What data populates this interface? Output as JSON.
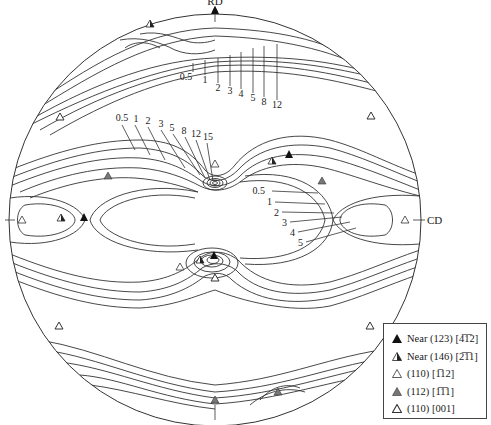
{
  "figure": {
    "type": "pole figure",
    "axes": {
      "top": "RD",
      "right": "CD"
    },
    "contour_levels_top": [
      "0.5",
      "1",
      "2",
      "3",
      "4",
      "5",
      "8",
      "12"
    ],
    "contour_levels_upper_center": [
      "0.5",
      "1",
      "2",
      "3",
      "5",
      "8",
      "12",
      "15"
    ],
    "contour_levels_right": [
      "0.5",
      "1",
      "2",
      "3",
      "4",
      "5"
    ]
  },
  "legend": {
    "items": [
      {
        "marker": "filled-triangle",
        "label": "Near (123) [4̅1̅2]"
      },
      {
        "marker": "half-filled-triangle",
        "label": "Near (146) [2̅1̅1]"
      },
      {
        "marker": "open-triangle",
        "label": "(110) [1̅12]"
      },
      {
        "marker": "grey-filled-triangle",
        "label": "(112) [1̅1̅1]"
      },
      {
        "marker": "dotted-triangle",
        "label": "(110) [001]"
      }
    ]
  }
}
